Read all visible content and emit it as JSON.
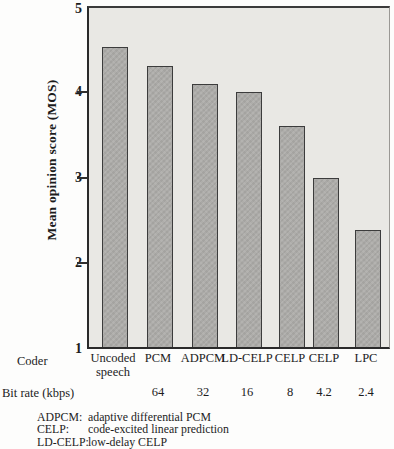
{
  "chart_data": {
    "type": "bar",
    "title": "",
    "ylabel": "Mean opinion score (MOS)",
    "ylim": [
      1,
      5
    ],
    "yticks": [
      5,
      4,
      3,
      2,
      1
    ],
    "grid": false,
    "legend_position": "none",
    "categories": [
      "Uncoded speech",
      "PCM",
      "ADPCM",
      "LD-CELP",
      "CELP",
      "CELP",
      "LPC"
    ],
    "bit_rates_kbps": [
      "",
      "64",
      "32",
      "16",
      "8",
      "4.2",
      "2.4"
    ],
    "values": [
      4.5,
      4.28,
      4.07,
      3.97,
      3.58,
      2.97,
      2.36
    ],
    "bar_color": "#aeadaa",
    "plot_background": "#e9e8e4",
    "axis_color": "#2a2a2a"
  },
  "axis": {
    "ylabel": "Mean opinion score (MOS)",
    "ytick_labels": [
      "5",
      "4",
      "3",
      "2",
      "1"
    ]
  },
  "rows": {
    "coder_row_label": "Coder",
    "bitrate_row_label": "Bit rate (kbps)"
  },
  "footnotes": [
    {
      "term": "ADPCM:",
      "definition": "adaptive differential PCM"
    },
    {
      "term": "CELP:",
      "definition": "code-excited linear prediction"
    },
    {
      "term": "LD-CELP:",
      "definition": "low-delay CELP"
    }
  ]
}
